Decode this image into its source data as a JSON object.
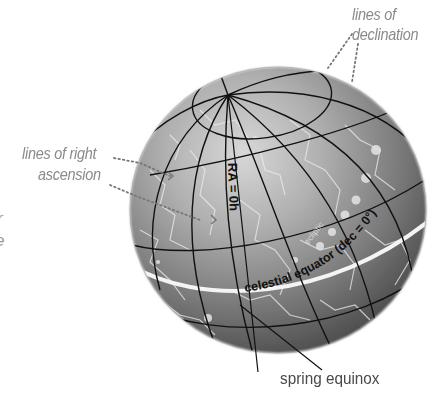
{
  "diagram": {
    "labels": {
      "declination_line1": "lines of",
      "declination_line2": "declination",
      "ra_line1": "lines of right",
      "ra_line2": "ascension",
      "ra_zero": "RA = 0h",
      "ecliptic": "ecliptic",
      "celestial_equator": "celestial equator (dec = 0°)",
      "spring_equinox": "spring equinox"
    },
    "cropped_fragments": [
      "r",
      "e"
    ],
    "colors": {
      "background": "#ffffff",
      "sphere_highlight": "#d2d2d2",
      "sphere_mid": "#8e8e8e",
      "sphere_shadow": "#4e4e4e",
      "grid_lines": "#111111",
      "constellation_lines": "#e6e6e6",
      "equator_band": "#f2f2f2",
      "callout_label": "#8a8a8a",
      "equinox_label": "#4a4a4a"
    }
  }
}
